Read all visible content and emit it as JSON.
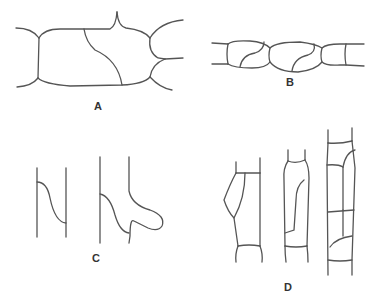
{
  "figure": {
    "panels": [
      {
        "id": "A",
        "label": "A",
        "description": "Rectangular cell with curved oblique division wall, flanked by neighbouring cells"
      },
      {
        "id": "B",
        "label": "B",
        "description": "Filament of rounded cells, two with S-shaped oblique division walls"
      },
      {
        "id": "C",
        "label": "C",
        "description": "Two cell outlines showing curved wall and protruding lobe"
      },
      {
        "id": "D",
        "label": "D",
        "description": "Three elongated cells in files with longitudinal and transverse divisions"
      }
    ],
    "colors": {
      "line": "#555555",
      "background": "#ffffff",
      "label": "#333333"
    }
  }
}
